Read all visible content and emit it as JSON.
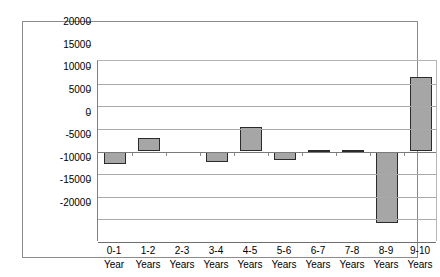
{
  "chart_data": {
    "type": "bar",
    "title": "",
    "subtitle": "",
    "xlabel": "",
    "ylabel": "",
    "ylim": [
      -20000,
      20000
    ],
    "grid": true,
    "legend": false,
    "legend_position": "none",
    "bar_fill_color": "#a6a6a6",
    "bar_border_color": "#2b2b2b",
    "plot_background": "#ffffff",
    "gridline_color": "#a9a9a9",
    "categories": [
      "0-1 Year",
      "1-2 Years",
      "2-3 Years",
      "3-4 Years",
      "4-5 Years",
      "5-6 Years",
      "6-7 Years",
      "7-8 Years",
      "8-9 Years",
      "9-10 Years"
    ],
    "category_lines": [
      [
        "0-1",
        "Year"
      ],
      [
        "1-2",
        "Years"
      ],
      [
        "2-3",
        "Years"
      ],
      [
        "3-4",
        "Years"
      ],
      [
        "4-5",
        "Years"
      ],
      [
        "5-6",
        "Years"
      ],
      [
        "6-7",
        "Years"
      ],
      [
        "7-8",
        "Years"
      ],
      [
        "8-9",
        "Years"
      ],
      [
        "9-10",
        "Years"
      ]
    ],
    "values": [
      -2700,
      2900,
      0,
      -2300,
      5500,
      -1800,
      250,
      350,
      -15800,
      16500
    ],
    "yticks": [
      20000,
      15000,
      10000,
      5000,
      0,
      -5000,
      -10000,
      -15000,
      -20000
    ],
    "ytick_labels": [
      "20000",
      "15000",
      "10000",
      "5000",
      "0",
      "-5000",
      "-10000",
      "-15000",
      "-20000"
    ]
  }
}
